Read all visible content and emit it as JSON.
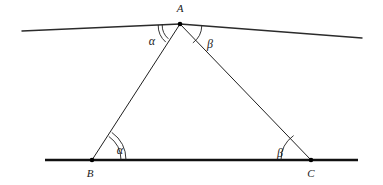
{
  "diagram": {
    "type": "geometry-figure",
    "background_color": "#ffffff",
    "ink_color": "#1f1f1f",
    "vertices": [
      {
        "id": "A",
        "label": "A",
        "x": 180,
        "y": 24,
        "label_x": 180,
        "label_y": 12,
        "dot": true
      },
      {
        "id": "B",
        "label": "B",
        "x": 92,
        "y": 160,
        "label_x": 90,
        "label_y": 177,
        "dot": true
      },
      {
        "id": "C",
        "label": "C",
        "x": 311,
        "y": 160,
        "label_x": 311,
        "label_y": 177,
        "dot": true
      }
    ],
    "lines": {
      "upper_line_left": {
        "x1": 22,
        "y1": 31,
        "x2": 180,
        "y2": 24
      },
      "upper_line_right": {
        "x1": 180,
        "y1": 24,
        "x2": 362,
        "y2": 38
      },
      "base_line": {
        "x1": 45,
        "y1": 160,
        "x2": 358,
        "y2": 160
      },
      "side_ab": {
        "x1": 180,
        "y1": 24,
        "x2": 92,
        "y2": 160
      },
      "side_ac": {
        "x1": 180,
        "y1": 24,
        "x2": 311,
        "y2": 160
      }
    },
    "angles": [
      {
        "id": "alpha-at-A",
        "symbol": "α",
        "vertex": "A",
        "arcs": 2,
        "label_x": 152,
        "label_y": 45
      },
      {
        "id": "beta-at-A",
        "symbol": "β",
        "vertex": "A",
        "arcs": 1,
        "label_x": 210,
        "label_y": 48
      },
      {
        "id": "alpha-at-B",
        "symbol": "α",
        "vertex": "B",
        "arcs": 2,
        "label_x": 120,
        "label_y": 154
      },
      {
        "id": "beta-at-C",
        "symbol": "β",
        "vertex": "C",
        "arcs": 1,
        "label_x": 280,
        "label_y": 157
      }
    ]
  }
}
